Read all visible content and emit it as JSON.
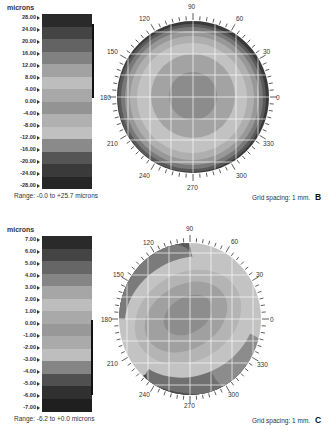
{
  "chart_data": [
    {
      "type": "heatmap",
      "panel_label": "B",
      "title": "",
      "colorbar_label": "microns",
      "colorbar_ticks": [
        "28.00",
        "24.00",
        "20.00",
        "16.00",
        "12.00",
        "8.00",
        "4.00",
        "0.00",
        "-4.00",
        "-8.00",
        "-12.00",
        "-16.00",
        "-20.00",
        "-24.00",
        "-28.00"
      ],
      "colorbar_bands": [
        "#2a2a2a",
        "#444444",
        "#636363",
        "#818181",
        "#a2a2a2",
        "#bdbdbd",
        "#c6c6c6",
        "#a8a8a8",
        "#939393",
        "#b0b0b0",
        "#c0c0c0",
        "#8a8a8a",
        "#555555",
        "#333333"
      ],
      "highlight_range": [
        "24.00",
        "0.00"
      ],
      "polar_axis_labels": [
        "90",
        "60",
        "30",
        "0",
        "330",
        "300",
        "270",
        "240",
        "210",
        "180",
        "150",
        "120"
      ],
      "range_text": "Range: -0.0 to +25.7 microns",
      "grid_text": "Grid spacing: 1 mm.",
      "map_shape": "concentric rings, dark center, darker rim",
      "value_range": [
        -0.0,
        25.7
      ]
    },
    {
      "type": "heatmap",
      "panel_label": "C",
      "title": "",
      "colorbar_label": "microns",
      "colorbar_ticks": [
        "7.00",
        "6.00",
        "5.00",
        "4.00",
        "3.00",
        "2.00",
        "1.00",
        "0.00",
        "-1.00",
        "-2.00",
        "-3.00",
        "-4.00",
        "-5.00",
        "-6.00",
        "-7.00"
      ],
      "colorbar_bands": [
        "#2a2a2a",
        "#444444",
        "#666666",
        "#858585",
        "#a6a6a6",
        "#bdbdbd",
        "#c3c3c3",
        "#989898",
        "#aaaaaa",
        "#bebebe",
        "#b4b4b4",
        "#858585",
        "#505050",
        "#303030"
      ],
      "highlight_range": [
        "0.00",
        "-6.00"
      ],
      "polar_axis_labels": [
        "90",
        "60",
        "30",
        "0",
        "330",
        "300",
        "270",
        "240",
        "210",
        "180",
        "150",
        "120"
      ],
      "range_text": "Range: -6.2 to +0.0 microns",
      "grid_text": "Grid spacing: 1 mm.",
      "map_shape": "oblique elliptical zones, dark upper-left and lower rims",
      "value_range": [
        -6.2,
        0.0
      ]
    }
  ],
  "panels": {
    "b": {
      "units": "microns",
      "ticks": [
        "28.00",
        "24.00",
        "20.00",
        "16.00",
        "12.00",
        "8.00",
        "4.00",
        "0.00",
        "-4.00",
        "-8.00",
        "-12.00",
        "-16.00",
        "-20.00",
        "-24.00",
        "-28.00"
      ],
      "range": "Range: -0.0 to +25.7 microns",
      "grid": "Grid spacing: 1 mm.",
      "letter": "B",
      "angles": {
        "a90": "90",
        "a60": "60",
        "a30": "30",
        "a0": "0",
        "a330": "330",
        "a300": "300",
        "a270": "270",
        "a240": "240",
        "a210": "210",
        "a180": "180",
        "a150": "150",
        "a120": "120"
      }
    },
    "c": {
      "units": "microns",
      "ticks": [
        "7.00",
        "6.00",
        "5.00",
        "4.00",
        "3.00",
        "2.00",
        "1.00",
        "0.00",
        "-1.00",
        "-2.00",
        "-3.00",
        "-4.00",
        "-5.00",
        "-6.00",
        "-7.00"
      ],
      "range": "Range: -6.2 to +0.0 microns",
      "grid": "Grid spacing: 1 mm.",
      "letter": "C",
      "angles": {
        "a90": "90",
        "a60": "60",
        "a30": "30",
        "a0": "0",
        "a330": "330",
        "a300": "300",
        "a270": "270",
        "a240": "240",
        "a210": "210",
        "a180": "180",
        "a150": "150",
        "a120": "120"
      }
    }
  }
}
